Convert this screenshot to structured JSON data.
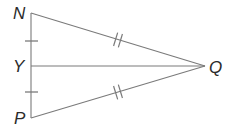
{
  "figure": {
    "type": "geometry-diagram",
    "background_color": "#ffffff",
    "line_color": "#7a7a7a",
    "tick_color": "#7a7a7a",
    "label_color": "#2b2b2b"
  },
  "points": [
    {
      "name": "N",
      "label": "N",
      "x": 31,
      "y": 13,
      "label_x": 13,
      "label_y": 19
    },
    {
      "name": "Y",
      "label": "Y",
      "x": 31,
      "y": 66,
      "label_x": 13,
      "label_y": 72
    },
    {
      "name": "P",
      "label": "P",
      "x": 31,
      "y": 118,
      "label_x": 14,
      "label_y": 124
    },
    {
      "name": "Q",
      "label": "Q",
      "x": 205,
      "y": 66,
      "label_x": 209,
      "label_y": 73
    }
  ],
  "segments": [
    {
      "name": "NP",
      "x1": 31,
      "y1": 13,
      "x2": 31,
      "y2": 118
    },
    {
      "name": "NQ",
      "x1": 31,
      "y1": 13,
      "x2": 205,
      "y2": 66
    },
    {
      "name": "PQ",
      "x1": 31,
      "y1": 118,
      "x2": 205,
      "y2": 66
    },
    {
      "name": "YQ",
      "x1": 31,
      "y1": 66,
      "x2": 205,
      "y2": 66
    }
  ],
  "tick_marks": [
    {
      "name": "tick-NY",
      "segment": "NY",
      "count": 1,
      "cx": 31,
      "cy": 41,
      "angle": 90
    },
    {
      "name": "tick-YP",
      "segment": "YP",
      "count": 1,
      "cx": 31,
      "cy": 92,
      "angle": 90
    },
    {
      "name": "tick-NQ",
      "segment": "NQ",
      "count": 2,
      "cx": 118,
      "cy": 40,
      "angle": 17
    },
    {
      "name": "tick-PQ",
      "segment": "PQ",
      "count": 2,
      "cx": 118,
      "cy": 92,
      "angle": -17
    }
  ]
}
